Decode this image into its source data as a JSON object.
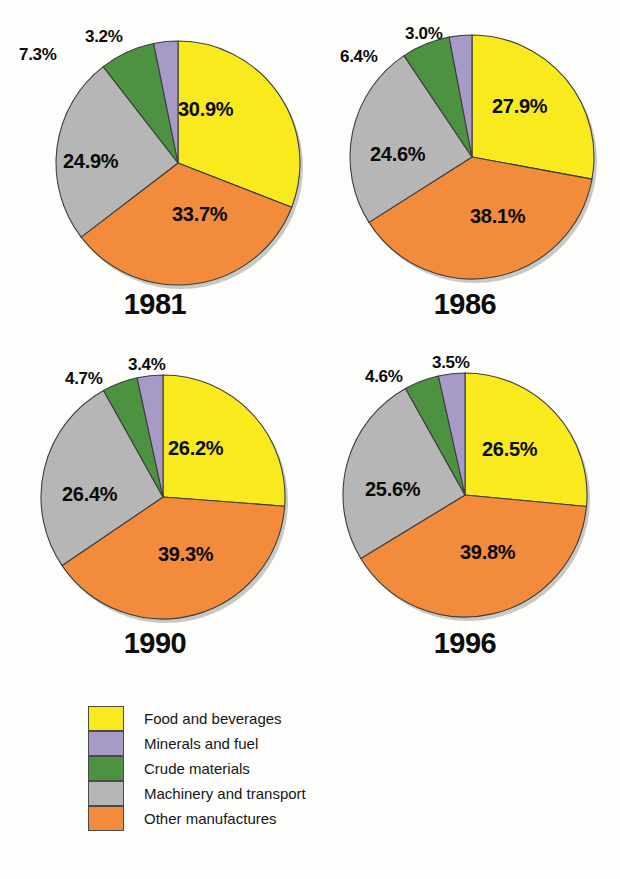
{
  "chart_data": {
    "type": "pie",
    "title": "",
    "legend_position": "bottom-left",
    "categories": [
      "Food and beverages",
      "Minerals and fuel",
      "Crude materials",
      "Machinery and transport",
      "Other manufactures"
    ],
    "colors": [
      "#f9ea1e",
      "#a89ac7",
      "#4c9240",
      "#b6b6b6",
      "#f28b3c"
    ],
    "units": "percent",
    "charts": [
      {
        "title": "1981",
        "categories": [
          "Food and beverages",
          "Other manufactures",
          "Machinery and transport",
          "Crude materials",
          "Minerals and fuel"
        ],
        "values": [
          30.9,
          33.7,
          24.9,
          7.3,
          3.2
        ],
        "labels": [
          "30.9%",
          "33.7%",
          "24.9%",
          "7.3%",
          "3.2%"
        ]
      },
      {
        "title": "1986",
        "categories": [
          "Food and beverages",
          "Other manufactures",
          "Machinery and transport",
          "Crude materials",
          "Minerals and fuel"
        ],
        "values": [
          27.9,
          38.1,
          24.6,
          6.4,
          3.0
        ],
        "labels": [
          "27.9%",
          "38.1%",
          "24.6%",
          "6.4%",
          "3.0%"
        ]
      },
      {
        "title": "1990",
        "categories": [
          "Food and beverages",
          "Other manufactures",
          "Machinery and transport",
          "Crude materials",
          "Minerals and fuel"
        ],
        "values": [
          26.2,
          39.3,
          26.4,
          4.7,
          3.4
        ],
        "labels": [
          "26.2%",
          "39.3%",
          "26.4%",
          "4.7%",
          "3.4%"
        ]
      },
      {
        "title": "1996",
        "categories": [
          "Food and beverages",
          "Other manufactures",
          "Machinery and transport",
          "Crude materials",
          "Minerals and fuel"
        ],
        "values": [
          26.5,
          39.8,
          25.6,
          4.6,
          3.5
        ],
        "labels": [
          "26.5%",
          "39.8%",
          "25.6%",
          "4.6%",
          "3.5%"
        ]
      }
    ]
  },
  "pies": [
    {
      "year": "1981",
      "inside_labels": [
        {
          "text": "30.9%",
          "x": 178,
          "y": 98
        },
        {
          "text": "33.7%",
          "x": 172,
          "y": 203
        }
      ],
      "outside_labels": [
        {
          "text": "24.9%",
          "x": 63,
          "y": 150,
          "inside": true
        },
        {
          "text": "7.3%",
          "x": 19,
          "y": 45
        },
        {
          "text": "3.2%",
          "x": 85,
          "y": 27
        }
      ]
    },
    {
      "year": "1986",
      "inside_labels": [
        {
          "text": "27.9%",
          "x": 182,
          "y": 95
        },
        {
          "text": "38.1%",
          "x": 160,
          "y": 205
        }
      ],
      "outside_labels": [
        {
          "text": "24.6%",
          "x": 60,
          "y": 143,
          "inside": true
        },
        {
          "text": "6.4%",
          "x": 30,
          "y": 47
        },
        {
          "text": "3.0%",
          "x": 95,
          "y": 24
        }
      ]
    },
    {
      "year": "1990",
      "inside_labels": [
        {
          "text": "26.2%",
          "x": 168,
          "y": 92
        },
        {
          "text": "39.3%",
          "x": 158,
          "y": 198
        }
      ],
      "outside_labels": [
        {
          "text": "26.4%",
          "x": 62,
          "y": 138,
          "inside": true
        },
        {
          "text": "4.7%",
          "x": 65,
          "y": 24
        },
        {
          "text": "3.4%",
          "x": 128,
          "y": 10
        }
      ]
    },
    {
      "year": "1996",
      "inside_labels": [
        {
          "text": "26.5%",
          "x": 172,
          "y": 93
        },
        {
          "text": "39.8%",
          "x": 150,
          "y": 196
        }
      ],
      "outside_labels": [
        {
          "text": "25.6%",
          "x": 55,
          "y": 133,
          "inside": true
        },
        {
          "text": "4.6%",
          "x": 55,
          "y": 22
        },
        {
          "text": "3.5%",
          "x": 122,
          "y": 8
        }
      ]
    }
  ],
  "legend": {
    "items": [
      {
        "label": "Food and beverages",
        "color": "#f9ea1e"
      },
      {
        "label": "Minerals and fuel",
        "color": "#a89ac7"
      },
      {
        "label": "Crude materials",
        "color": "#4c9240"
      },
      {
        "label": "Machinery and transport",
        "color": "#b6b6b6"
      },
      {
        "label": "Other manufactures",
        "color": "#f28b3c"
      }
    ]
  }
}
